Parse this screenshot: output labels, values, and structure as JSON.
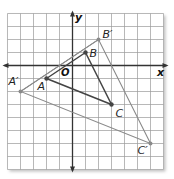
{
  "diagram": {
    "type": "coordinate-plane-dilation",
    "grid": {
      "x_min": -5,
      "x_max": 7,
      "y_min": -8,
      "y_max": 4,
      "cell_px": 13,
      "origin_px": [
        72.5,
        65.5
      ],
      "left_px": 7.5,
      "top_px": 13.5,
      "line_color": "#9a9a9a",
      "axis_color": "#333333"
    },
    "axes": {
      "x_label": "x",
      "y_label": "y",
      "origin_label": "O"
    },
    "preimage": {
      "name": "ABC",
      "color": "#444444",
      "points": [
        {
          "label": "A",
          "x": -2,
          "y": -1
        },
        {
          "label": "B",
          "x": 1,
          "y": 1
        },
        {
          "label": "C",
          "x": 3,
          "y": -3
        }
      ]
    },
    "image": {
      "name": "A'B'C'",
      "color": "#8a8a8a",
      "points": [
        {
          "label": "A′",
          "x": -4,
          "y": -2
        },
        {
          "label": "B′",
          "x": 2,
          "y": 2
        },
        {
          "label": "C′",
          "x": 6,
          "y": -6
        }
      ]
    },
    "center_ray_color": "#8a8a8a"
  }
}
